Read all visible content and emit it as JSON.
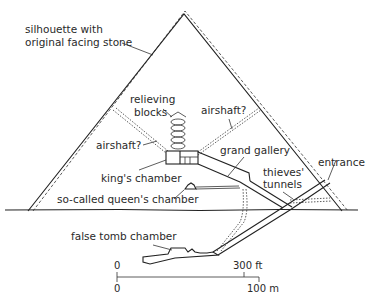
{
  "diagram": {
    "labels": {
      "silhouette_line1": "silhouette with",
      "silhouette_line2": "original facing stone",
      "relieving_line1": "relieving",
      "relieving_line2": "blocks",
      "airshaft_left": "airshaft?",
      "airshaft_right": "airshaft?",
      "grand_gallery": "grand gallery",
      "kings_chamber": "king's chamber",
      "queens_chamber": "so-called queen's chamber",
      "thieves_line1": "thieves'",
      "thieves_line2": "tunnels",
      "entrance": "entrance",
      "false_tomb": "false tomb chamber"
    },
    "scale_bar": {
      "ft_zero": "0",
      "ft_label": "300 ft",
      "m_zero": "0",
      "m_label": "100 m"
    },
    "colors": {
      "line": "#222222",
      "background": "#ffffff"
    }
  }
}
